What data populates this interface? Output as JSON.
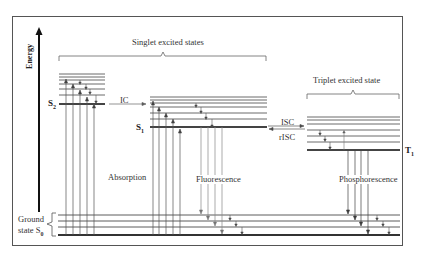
{
  "diagram": {
    "axis_label": "Energy",
    "groups": {
      "singlet": "Singlet excited states",
      "triplet": "Triplet excited state",
      "ground": "Ground\nstate S0"
    },
    "ground_label_line1": "Ground",
    "ground_label_line2": "state S",
    "ground_sub": "0",
    "states": {
      "s2": {
        "name": "S",
        "sub": "2"
      },
      "s1": {
        "name": "S",
        "sub": "1"
      },
      "t1": {
        "name": "T",
        "sub": "1"
      }
    },
    "processes": {
      "ic": "IC",
      "isc": "ISC",
      "risc": "rISC",
      "absorption": "Absorption",
      "fluorescence": "Fluorescence",
      "phosphorescence": "Phosphorescence"
    },
    "colors": {
      "line": "#333333",
      "thin_line": "#555555",
      "frame": "#555555",
      "background": "#ffffff"
    }
  }
}
